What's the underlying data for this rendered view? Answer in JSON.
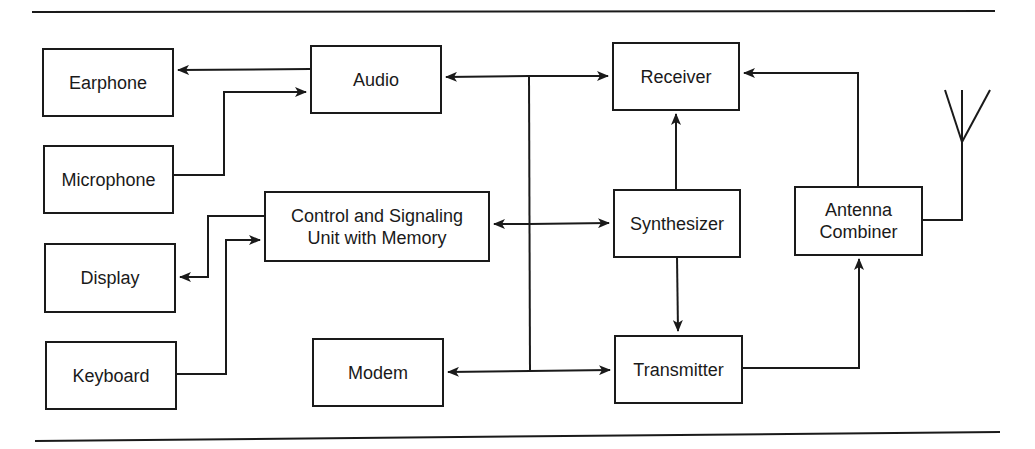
{
  "diagram": {
    "type": "block-diagram",
    "title": "",
    "colors": {
      "line": "#1a1a1a",
      "background": "#ffffff"
    },
    "blocks": {
      "earphone": {
        "label": "Earphone"
      },
      "microphone": {
        "label": "Microphone"
      },
      "display": {
        "label": "Display"
      },
      "keyboard": {
        "label": "Keyboard"
      },
      "audio": {
        "label": "Audio"
      },
      "control": {
        "label": "Control and Signaling\nUnit with Memory"
      },
      "modem": {
        "label": "Modem"
      },
      "receiver": {
        "label": "Receiver"
      },
      "synthesizer": {
        "label": "Synthesizer"
      },
      "transmitter": {
        "label": "Transmitter"
      },
      "antenna_combiner": {
        "label": "Antenna\nCombiner"
      }
    },
    "antenna": {
      "icon": "antenna-icon"
    },
    "connections": [
      {
        "from": "Audio",
        "to": "Earphone",
        "direction": "one-way"
      },
      {
        "from": "Microphone",
        "to": "Audio",
        "direction": "one-way"
      },
      {
        "from": "Control and Signaling Unit with Memory",
        "to": "Display",
        "direction": "one-way"
      },
      {
        "from": "Keyboard",
        "to": "Control and Signaling Unit with Memory",
        "direction": "one-way"
      },
      {
        "from": "Bus",
        "to": "Audio",
        "direction": "one-way"
      },
      {
        "from": "Bus",
        "to": "Control and Signaling Unit with Memory",
        "direction": "one-way"
      },
      {
        "from": "Bus",
        "to": "Modem",
        "direction": "one-way"
      },
      {
        "from": "Bus",
        "to": "Receiver",
        "direction": "one-way"
      },
      {
        "from": "Bus",
        "to": "Synthesizer",
        "direction": "one-way"
      },
      {
        "from": "Bus",
        "to": "Transmitter",
        "direction": "one-way"
      },
      {
        "from": "Synthesizer",
        "to": "Receiver",
        "direction": "one-way"
      },
      {
        "from": "Synthesizer",
        "to": "Transmitter",
        "direction": "one-way"
      },
      {
        "from": "Antenna Combiner",
        "to": "Receiver",
        "direction": "one-way"
      },
      {
        "from": "Transmitter",
        "to": "Antenna Combiner",
        "direction": "one-way"
      },
      {
        "from": "Antenna Combiner",
        "to": "Antenna",
        "direction": "line"
      }
    ]
  }
}
